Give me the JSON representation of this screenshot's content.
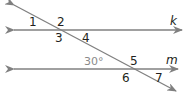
{
  "diagram": {
    "line_color": "#808080",
    "text_color": "#231f20",
    "angle_color": "#8a8a8a",
    "lines": {
      "k": "k",
      "m": "m"
    },
    "angle_labels": [
      "1",
      "2",
      "3",
      "4",
      "5",
      "6",
      "7"
    ],
    "given_angle": "30°"
  }
}
